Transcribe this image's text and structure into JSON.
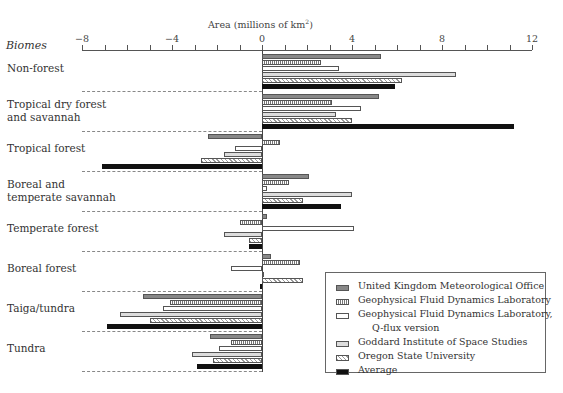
{
  "chart_data": {
    "type": "bar",
    "orientation": "horizontal",
    "title": "",
    "xlabel": "Area (millions of km²)",
    "ylabel": "Biomes",
    "xlim": [
      -8,
      12
    ],
    "xticks": [
      -8,
      -4,
      0,
      4,
      8,
      12
    ],
    "categories": [
      "Non-forest",
      "Tropical dry forest and savannah",
      "Tropical forest",
      "Boreal and temperate savannah",
      "Temperate forest",
      "Boreal forest",
      "Taiga/tundra",
      "Tundra"
    ],
    "series": [
      {
        "name": "United Kingdom Meteorological Office",
        "pattern": "dark-gray",
        "values": [
          5.3,
          5.2,
          -2.4,
          2.1,
          0.2,
          0.4,
          -5.3,
          -2.3
        ]
      },
      {
        "name": "Geophysical Fluid Dynamics Laboratory",
        "pattern": "vertical-hatch",
        "values": [
          2.6,
          3.1,
          0.8,
          1.2,
          -1.0,
          1.7,
          -4.1,
          -1.4
        ]
      },
      {
        "name": "Geophysical Fluid Dynamics Laboratory, Q-flux version",
        "pattern": "white",
        "values": [
          3.4,
          4.4,
          -1.2,
          0.2,
          4.1,
          -1.4,
          -4.4,
          -1.9
        ]
      },
      {
        "name": "Goddard Institute of Space Studies",
        "pattern": "light-gray",
        "values": [
          8.6,
          3.3,
          -1.7,
          4.0,
          -1.7,
          0.1,
          -6.3,
          -3.1
        ]
      },
      {
        "name": "Oregon State University",
        "pattern": "crosshatch",
        "values": [
          6.2,
          4.0,
          -2.7,
          1.8,
          -0.6,
          1.8,
          -5.0,
          -2.2
        ]
      },
      {
        "name": "Average",
        "pattern": "black",
        "values": [
          5.9,
          11.2,
          -7.1,
          3.5,
          -0.6,
          -0.1,
          -6.9,
          -2.9
        ]
      }
    ],
    "grid": false,
    "legend_position": "lower-right"
  },
  "axis": {
    "title_prefix": "Area (millions of km",
    "title_sup": "2",
    "title_suffix": ")",
    "ylabel": "Biomes",
    "ticks": [
      "−8",
      "−4",
      "0",
      "4",
      "8",
      "12"
    ]
  },
  "category_labels": [
    [
      "Non-forest"
    ],
    [
      "Tropical dry forest",
      "and savannah"
    ],
    [
      "Tropical forest"
    ],
    [
      "Boreal and",
      "temperate savannah"
    ],
    [
      "Temperate forest"
    ],
    [
      "Boreal forest"
    ],
    [
      "Taiga/tundra"
    ],
    [
      "Tundra"
    ]
  ],
  "legend": [
    {
      "label": "United Kingdom Meteorological Office"
    },
    {
      "label": "Geophysical Fluid Dynamics Laboratory"
    },
    {
      "label": "Geophysical Fluid Dynamics Laboratory,",
      "label2": "Q-flux version"
    },
    {
      "label": "Goddard Institute of Space Studies"
    },
    {
      "label": "Oregon State University"
    },
    {
      "label": "Average"
    }
  ]
}
